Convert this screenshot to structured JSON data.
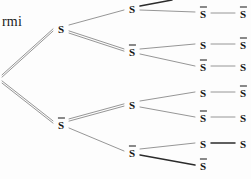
{
  "figure": {
    "kind": "binary-tree-diagram",
    "width": 251,
    "height": 179,
    "background_color": "#fdfdfd",
    "ink_color": "#161616",
    "edge_color": "#8a8a8a",
    "edge_color_dark": "#2b2b2b",
    "caption_fragment": "rmi",
    "caption_x": 2,
    "caption_y": 14
  },
  "symbols": {
    "plain": "S",
    "barred": "S"
  },
  "nodes": [
    {
      "id": "root",
      "label": "",
      "bar": false,
      "x": 2,
      "y": 79,
      "level": 0,
      "visible": false
    },
    {
      "id": "l1-a",
      "label": "S",
      "bar": false,
      "x": 61,
      "y": 28,
      "level": 1,
      "visible": true
    },
    {
      "id": "l1-b",
      "label": "S",
      "bar": true,
      "x": 61,
      "y": 124,
      "level": 1,
      "visible": true
    },
    {
      "id": "l2-a",
      "label": "S",
      "bar": false,
      "x": 132,
      "y": 8,
      "level": 2,
      "visible": true
    },
    {
      "id": "l2-b",
      "label": "S",
      "bar": true,
      "x": 132,
      "y": 51,
      "level": 2,
      "visible": true
    },
    {
      "id": "l2-c",
      "label": "S",
      "bar": false,
      "x": 132,
      "y": 104,
      "level": 2,
      "visible": true
    },
    {
      "id": "l2-d",
      "label": "S",
      "bar": true,
      "x": 132,
      "y": 152,
      "level": 2,
      "visible": true
    },
    {
      "id": "l3-1",
      "label": "S",
      "bar": true,
      "x": 203,
      "y": 13,
      "level": 3,
      "visible": true
    },
    {
      "id": "l3-2",
      "label": "S",
      "bar": false,
      "x": 203,
      "y": 44,
      "level": 3,
      "visible": true
    },
    {
      "id": "l3-3",
      "label": "S",
      "bar": true,
      "x": 203,
      "y": 66,
      "level": 3,
      "visible": true
    },
    {
      "id": "l3-4",
      "label": "S",
      "bar": false,
      "x": 203,
      "y": 92,
      "level": 3,
      "visible": true
    },
    {
      "id": "l3-5",
      "label": "S",
      "bar": true,
      "x": 203,
      "y": 117,
      "level": 3,
      "visible": true
    },
    {
      "id": "l3-6",
      "label": "S",
      "bar": false,
      "x": 203,
      "y": 143,
      "level": 3,
      "visible": true
    },
    {
      "id": "l3-7",
      "label": "S",
      "bar": true,
      "x": 203,
      "y": 165,
      "level": 3,
      "visible": true
    },
    {
      "id": "l4-1",
      "label": "S",
      "bar": true,
      "x": 243,
      "y": 13,
      "level": 4,
      "visible": true
    },
    {
      "id": "l4-2",
      "label": "S",
      "bar": true,
      "x": 243,
      "y": 44,
      "level": 4,
      "visible": true
    },
    {
      "id": "l4-3",
      "label": "S",
      "bar": false,
      "x": 243,
      "y": 66,
      "level": 4,
      "visible": true
    },
    {
      "id": "l4-4",
      "label": "S",
      "bar": true,
      "x": 243,
      "y": 92,
      "level": 4,
      "visible": true
    },
    {
      "id": "l4-5",
      "label": "S",
      "bar": false,
      "x": 243,
      "y": 117,
      "level": 4,
      "visible": true
    },
    {
      "id": "l4-6",
      "label": "S",
      "bar": false,
      "x": 243,
      "y": 143,
      "level": 4,
      "visible": true
    }
  ],
  "edges": [
    {
      "from": "root",
      "to": "l1-a",
      "x1": 2,
      "y1": 76,
      "x2": 53,
      "y2": 30,
      "style": "double",
      "shade": "light"
    },
    {
      "from": "root",
      "to": "l1-b",
      "x1": 2,
      "y1": 82,
      "x2": 53,
      "y2": 122,
      "style": "double",
      "shade": "light"
    },
    {
      "from": "l1-a",
      "to": "l2-a",
      "x1": 69,
      "y1": 25,
      "x2": 124,
      "y2": 10,
      "style": "single",
      "shade": "light"
    },
    {
      "from": "l1-a",
      "to": "l2-b",
      "x1": 69,
      "y1": 32,
      "x2": 124,
      "y2": 50,
      "style": "double",
      "shade": "light"
    },
    {
      "from": "l1-b",
      "to": "l2-c",
      "x1": 69,
      "y1": 120,
      "x2": 124,
      "y2": 105,
      "style": "double",
      "shade": "light"
    },
    {
      "from": "l1-b",
      "to": "l2-d",
      "x1": 69,
      "y1": 128,
      "x2": 124,
      "y2": 151,
      "style": "single",
      "shade": "light"
    },
    {
      "from": "l2-a",
      "to": "off-top",
      "x1": 140,
      "y1": 6,
      "x2": 172,
      "y2": 0,
      "style": "single",
      "shade": "dark"
    },
    {
      "from": "l2-a",
      "to": "l3-1",
      "x1": 140,
      "y1": 10,
      "x2": 195,
      "y2": 12,
      "style": "single",
      "shade": "light"
    },
    {
      "from": "l2-b",
      "to": "l3-2",
      "x1": 140,
      "y1": 49,
      "x2": 195,
      "y2": 44,
      "style": "single",
      "shade": "light"
    },
    {
      "from": "l2-b",
      "to": "l3-3",
      "x1": 140,
      "y1": 54,
      "x2": 195,
      "y2": 66,
      "style": "single",
      "shade": "light"
    },
    {
      "from": "l2-c",
      "to": "l3-4",
      "x1": 140,
      "y1": 101,
      "x2": 195,
      "y2": 92,
      "style": "single",
      "shade": "light"
    },
    {
      "from": "l2-c",
      "to": "l3-5",
      "x1": 140,
      "y1": 107,
      "x2": 195,
      "y2": 117,
      "style": "single",
      "shade": "light"
    },
    {
      "from": "l2-d",
      "to": "l3-6",
      "x1": 140,
      "y1": 149,
      "x2": 195,
      "y2": 143,
      "style": "single",
      "shade": "light"
    },
    {
      "from": "l2-d",
      "to": "l3-7",
      "x1": 140,
      "y1": 155,
      "x2": 195,
      "y2": 165,
      "style": "single",
      "shade": "dark"
    },
    {
      "from": "l3-1",
      "to": "l4-1",
      "x1": 211,
      "y1": 13,
      "x2": 235,
      "y2": 13,
      "style": "single",
      "shade": "light"
    },
    {
      "from": "l3-2",
      "to": "l4-2",
      "x1": 211,
      "y1": 44,
      "x2": 235,
      "y2": 44,
      "style": "single",
      "shade": "light"
    },
    {
      "from": "l3-3",
      "to": "l4-3",
      "x1": 211,
      "y1": 66,
      "x2": 235,
      "y2": 66,
      "style": "single",
      "shade": "light"
    },
    {
      "from": "l3-4",
      "to": "l4-4",
      "x1": 211,
      "y1": 92,
      "x2": 235,
      "y2": 92,
      "style": "single",
      "shade": "light"
    },
    {
      "from": "l3-5",
      "to": "l4-5",
      "x1": 211,
      "y1": 117,
      "x2": 235,
      "y2": 117,
      "style": "single",
      "shade": "light"
    },
    {
      "from": "l3-6",
      "to": "l4-6",
      "x1": 211,
      "y1": 143,
      "x2": 235,
      "y2": 143,
      "style": "single",
      "shade": "dark"
    }
  ]
}
